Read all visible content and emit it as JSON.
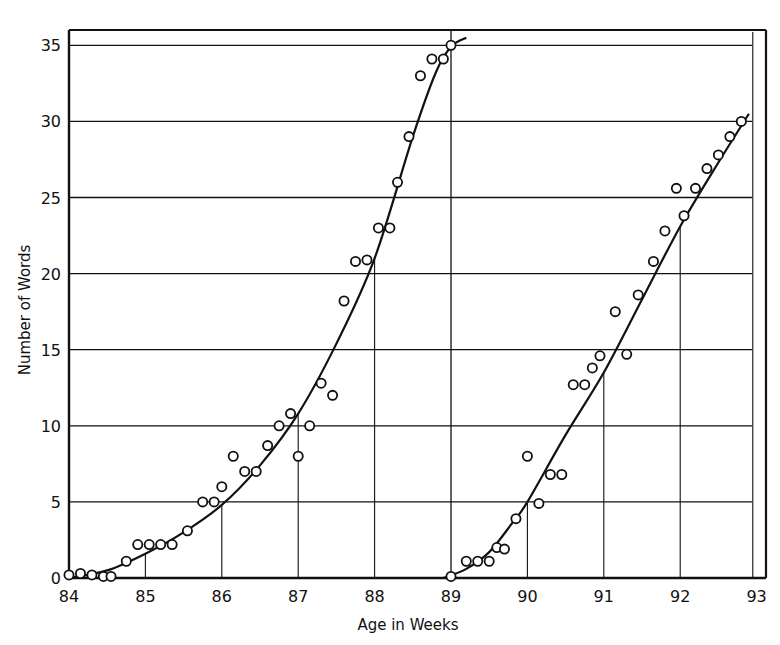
{
  "chart_data": {
    "type": "scatter",
    "title": "",
    "xlabel": "Age in Weeks",
    "ylabel": "Number of Words",
    "xlim": [
      84,
      93.2
    ],
    "ylim": [
      0,
      36
    ],
    "x_ticks": [
      "84",
      "85",
      "86",
      "87",
      "88",
      "89",
      "90",
      "91",
      "92",
      "93"
    ],
    "y_ticks": [
      "0",
      "5",
      "10",
      "15",
      "20",
      "25",
      "30",
      "35"
    ],
    "grid": "horizontal lines every 5 words; vertical drop lines at whole weeks from fitted curve",
    "legend": null,
    "panels": [
      {
        "name": "First series (weeks 84-89)",
        "points": [
          [
            84.0,
            0.2
          ],
          [
            84.15,
            0.3
          ],
          [
            84.3,
            0.2
          ],
          [
            84.45,
            0.1
          ],
          [
            84.55,
            0.1
          ],
          [
            84.75,
            1.1
          ],
          [
            84.9,
            2.2
          ],
          [
            85.05,
            2.2
          ],
          [
            85.2,
            2.2
          ],
          [
            85.35,
            2.2
          ],
          [
            85.55,
            3.1
          ],
          [
            85.75,
            5.0
          ],
          [
            85.9,
            5.0
          ],
          [
            86.0,
            6.0
          ],
          [
            86.15,
            8.0
          ],
          [
            86.3,
            7.0
          ],
          [
            86.45,
            7.0
          ],
          [
            86.6,
            8.7
          ],
          [
            86.75,
            10.0
          ],
          [
            86.9,
            10.8
          ],
          [
            87.0,
            8.0
          ],
          [
            87.15,
            10.0
          ],
          [
            87.3,
            12.8
          ],
          [
            87.45,
            12.0
          ],
          [
            87.6,
            18.2
          ],
          [
            87.75,
            20.8
          ],
          [
            87.9,
            20.9
          ],
          [
            88.05,
            23.0
          ],
          [
            88.2,
            23.0
          ],
          [
            88.3,
            26.0
          ],
          [
            88.45,
            29.0
          ],
          [
            88.6,
            33.0
          ],
          [
            88.75,
            34.1
          ],
          [
            88.9,
            34.1
          ],
          [
            89.0,
            35.0
          ]
        ],
        "curve": [
          [
            84.0,
            0.0
          ],
          [
            84.5,
            0.5
          ],
          [
            85.0,
            1.6
          ],
          [
            85.5,
            3.0
          ],
          [
            86.0,
            4.8
          ],
          [
            86.5,
            7.4
          ],
          [
            87.0,
            10.8
          ],
          [
            87.5,
            15.4
          ],
          [
            88.0,
            21.0
          ],
          [
            88.5,
            29.0
          ],
          [
            88.8,
            33.2
          ],
          [
            89.0,
            34.9
          ],
          [
            89.2,
            35.5
          ]
        ]
      },
      {
        "name": "Second series (weeks 89-93)",
        "points": [
          [
            89.0,
            0.1
          ],
          [
            89.2,
            1.1
          ],
          [
            89.35,
            1.1
          ],
          [
            89.5,
            1.1
          ],
          [
            89.6,
            2.0
          ],
          [
            89.7,
            1.9
          ],
          [
            89.85,
            3.9
          ],
          [
            90.0,
            8.0
          ],
          [
            90.15,
            4.9
          ],
          [
            90.3,
            6.8
          ],
          [
            90.45,
            6.8
          ],
          [
            90.6,
            12.7
          ],
          [
            90.75,
            12.7
          ],
          [
            90.85,
            13.8
          ],
          [
            90.95,
            14.6
          ],
          [
            91.15,
            17.5
          ],
          [
            91.3,
            14.7
          ],
          [
            91.45,
            18.6
          ],
          [
            91.65,
            20.8
          ],
          [
            91.8,
            22.8
          ],
          [
            91.95,
            25.6
          ],
          [
            92.05,
            23.8
          ],
          [
            92.2,
            25.6
          ],
          [
            92.35,
            26.9
          ],
          [
            92.5,
            27.8
          ],
          [
            92.65,
            29.0
          ],
          [
            92.8,
            30.0
          ]
        ],
        "curve": [
          [
            88.9,
            0.0
          ],
          [
            89.2,
            0.6
          ],
          [
            89.5,
            1.7
          ],
          [
            89.8,
            3.6
          ],
          [
            90.0,
            5.0
          ],
          [
            90.5,
            9.4
          ],
          [
            91.0,
            13.5
          ],
          [
            91.5,
            18.3
          ],
          [
            92.0,
            23.1
          ],
          [
            92.5,
            27.3
          ],
          [
            92.9,
            30.5
          ]
        ]
      }
    ]
  },
  "axis": {
    "xlabel": "Age in Weeks",
    "ylabel": "Number of Words",
    "x_ticks": [
      "84",
      "85",
      "86",
      "87",
      "88",
      "89",
      "90",
      "91",
      "92",
      "93"
    ],
    "y_ticks": [
      "0",
      "5",
      "10",
      "15",
      "20",
      "25",
      "30",
      "35"
    ]
  },
  "colors": {
    "ink": "#111111",
    "background": "#ffffff",
    "grid": "#222222"
  }
}
